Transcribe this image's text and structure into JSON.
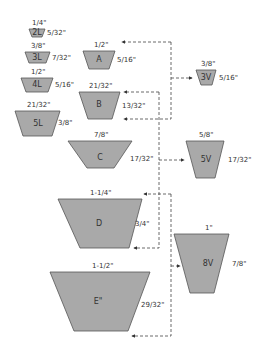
{
  "colors": {
    "fill": "#a9a9a9",
    "stroke": "#555555",
    "connector": "#444444",
    "text": "#333333"
  },
  "belts": [
    {
      "id": "2L",
      "name": "2L",
      "top_width": "1/4\"",
      "height": "5/32\""
    },
    {
      "id": "3L",
      "name": "3L",
      "top_width": "3/8\"",
      "height": "7/32\""
    },
    {
      "id": "4L",
      "name": "4L",
      "top_width": "1/2\"",
      "height": "5/16\""
    },
    {
      "id": "5L",
      "name": "5L",
      "top_width": "21/32\"",
      "height": "3/8\""
    },
    {
      "id": "A",
      "name": "A",
      "top_width": "1/2\"",
      "height": "5/16\""
    },
    {
      "id": "B",
      "name": "B",
      "top_width": "21/32\"",
      "height": "13/32\""
    },
    {
      "id": "C",
      "name": "C",
      "top_width": "7/8\"",
      "height": "17/32\""
    },
    {
      "id": "D",
      "name": "D",
      "top_width": "1-1/4\"",
      "height": "3/4\""
    },
    {
      "id": "E",
      "name": "E\"",
      "top_width": "1-1/2\"",
      "height": "29/32\""
    },
    {
      "id": "3V",
      "name": "3V",
      "top_width": "3/8\"",
      "height": "5/16\""
    },
    {
      "id": "5V",
      "name": "5V",
      "top_width": "5/8\"",
      "height": "17/32\""
    },
    {
      "id": "8V",
      "name": "8V",
      "top_width": "1\"",
      "height": "7/8\""
    }
  ],
  "connectors": [
    {
      "from": "3V",
      "to": [
        "A",
        "B"
      ]
    },
    {
      "from": "5V",
      "to": [
        "B",
        "C",
        "D"
      ]
    },
    {
      "from": "8V",
      "to": [
        "D",
        "E"
      ]
    }
  ]
}
